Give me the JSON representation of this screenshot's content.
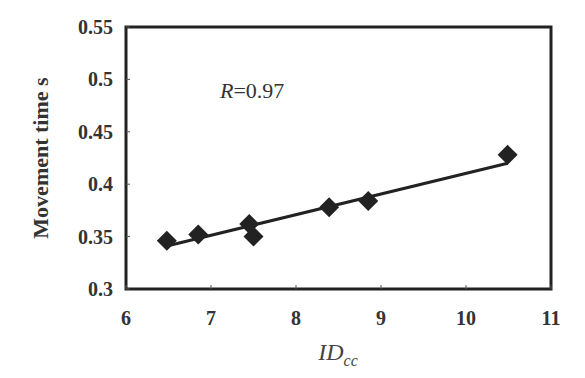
{
  "chart_data": {
    "type": "scatter",
    "title": "",
    "xlabel": "ID",
    "xlabel_subscript": "cc",
    "ylabel": "Movement time  s",
    "xlim": [
      6,
      11
    ],
    "ylim": [
      0.3,
      0.55
    ],
    "x_ticks": [
      6,
      7,
      8,
      9,
      10,
      11
    ],
    "x_tick_labels": [
      "6",
      "7",
      "8",
      "9",
      "10",
      "11"
    ],
    "y_ticks": [
      0.3,
      0.35,
      0.4,
      0.45,
      0.5,
      0.55
    ],
    "y_tick_labels": [
      "0.3",
      "0.35",
      "0.4",
      "0.45",
      "0.5",
      "0.55"
    ],
    "grid": false,
    "legend": null,
    "series": [
      {
        "name": "Movement time",
        "marker": "diamond",
        "color": "#222222",
        "x": [
          6.48,
          6.85,
          7.45,
          7.5,
          8.39,
          8.85,
          10.49
        ],
        "y": [
          0.346,
          0.352,
          0.362,
          0.35,
          0.378,
          0.384,
          0.428
        ]
      }
    ],
    "fit_line": {
      "type": "linear",
      "x": [
        6.48,
        10.49
      ],
      "y": [
        0.341,
        0.42
      ],
      "color": "#222222"
    },
    "annotations": [
      {
        "text_italic": "R",
        "text": "=0.97",
        "x": 7.15,
        "y": 0.505
      }
    ]
  },
  "labels": {
    "ylabel": "Movement time  s",
    "xlabel_main": "ID",
    "xlabel_sub": "cc",
    "r_italic": "R",
    "r_value": "=0.97"
  }
}
